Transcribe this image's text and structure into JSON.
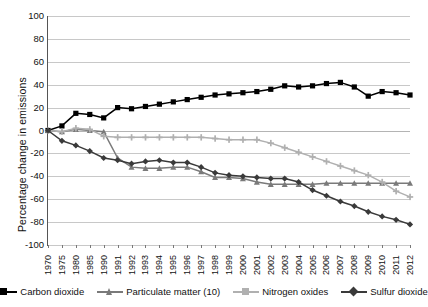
{
  "chart_data": {
    "type": "line",
    "title": "",
    "xlabel": "",
    "ylabel": "Percentage change in emissions",
    "ylim": [
      -100,
      100
    ],
    "ytick_values": [
      100,
      80,
      60,
      40,
      20,
      0,
      -20,
      -40,
      -60,
      -80,
      -100
    ],
    "ytick_labels": [
      "100",
      "80",
      "60",
      "40",
      "20",
      "0",
      "-20",
      "-40",
      "-60",
      "-80",
      "-100"
    ],
    "grid": true,
    "legend_position": "bottom",
    "categories": [
      "1970",
      "1975",
      "1980",
      "1985",
      "1990",
      "1991",
      "1992",
      "1993",
      "1994",
      "1995",
      "1996",
      "1997",
      "1998",
      "1999",
      "2000",
      "2001",
      "2002",
      "2003",
      "2004",
      "2005",
      "2006",
      "2007",
      "2008",
      "2009",
      "2010",
      "2011",
      "2012"
    ],
    "series": [
      {
        "name": "Carbon dioxide",
        "color": "#000000",
        "marker": "square",
        "values": [
          0,
          4,
          15,
          14,
          11,
          20,
          19,
          21,
          23,
          25,
          27,
          29,
          31,
          32,
          33,
          34,
          36,
          39,
          38,
          39,
          41,
          42,
          38,
          30,
          34,
          33,
          31
        ]
      },
      {
        "name": "Particulate matter (10)",
        "color": "#7a7a7a",
        "marker": "triangle",
        "values": [
          0,
          -1,
          1,
          0,
          -1,
          -24,
          -32,
          -33,
          -33,
          -32,
          -32,
          -36,
          -41,
          -41,
          -42,
          -45,
          -47,
          -47,
          -47,
          -47,
          -46,
          -46,
          -46,
          -46,
          -46,
          -46,
          -46
        ]
      },
      {
        "name": "Nitrogen oxides",
        "color": "#b0b0b0",
        "marker": "plus-square",
        "values": [
          0,
          -1,
          2,
          1,
          -5,
          -6,
          -6,
          -6,
          -6,
          -6,
          -6,
          -6,
          -7,
          -8,
          -8,
          -8,
          -11,
          -15,
          -19,
          -23,
          -27,
          -31,
          -35,
          -39,
          -45,
          -53,
          -58
        ]
      },
      {
        "name": "Sulfur dioxide",
        "color": "#3a3a3a",
        "marker": "diamond",
        "values": [
          0,
          -9,
          -13,
          -18,
          -24,
          -26,
          -29,
          -27,
          -26,
          -28,
          -28,
          -32,
          -37,
          -39,
          -40,
          -41,
          -42,
          -42,
          -45,
          -52,
          -57,
          -62,
          -66,
          -71,
          -75,
          -78,
          -82
        ]
      }
    ],
    "xtick_labels": [
      "1970",
      "1975",
      "1980",
      "1985",
      "1990",
      "1991",
      "1992",
      "1993",
      "1994",
      "1995",
      "1996",
      "1997",
      "1998",
      "1999",
      "2000",
      "2001",
      "2002",
      "2003",
      "2004",
      "2005",
      "2006",
      "2007",
      "2008",
      "2009",
      "2010",
      "2011",
      "2012"
    ]
  },
  "legend": {
    "items": [
      {
        "label": "Carbon dioxide",
        "color": "#000000",
        "marker": "square"
      },
      {
        "label": "Particulate matter (10)",
        "color": "#7a7a7a",
        "marker": "triangle"
      },
      {
        "label": "Nitrogen oxides",
        "color": "#b0b0b0",
        "marker": "plus-square"
      },
      {
        "label": "Sulfur dioxide",
        "color": "#3a3a3a",
        "marker": "diamond"
      }
    ]
  }
}
